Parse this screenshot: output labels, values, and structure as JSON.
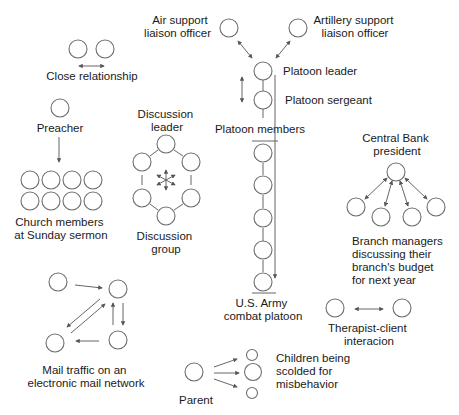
{
  "colors": {
    "background": "#ffffff",
    "stroke": "#6e6e6e",
    "text": "#1a1a1a"
  },
  "groups": {
    "close_relationship": {
      "label": [
        "Close relationship"
      ]
    },
    "preacher": {
      "label": [
        "Preacher"
      ],
      "members_label": [
        "Church members",
        "at Sunday sermon"
      ]
    },
    "discussion": {
      "leader_label": [
        "Discussion",
        "leader"
      ],
      "group_label": [
        "Discussion",
        "group"
      ]
    },
    "platoon": {
      "air_support": [
        "Air support",
        "liaison officer"
      ],
      "artillery_support": [
        "Artillery support",
        "liaison officer"
      ],
      "leader": [
        "Platoon leader"
      ],
      "sergeant": [
        "Platoon sergeant"
      ],
      "members": [
        "Platoon members"
      ],
      "unit": [
        "U.S. Army",
        "combat platoon"
      ]
    },
    "central_bank": {
      "label": [
        "Central Bank",
        "president"
      ],
      "managers_label": [
        "Branch managers",
        "discussing their",
        "branch's budget",
        "for next year"
      ]
    },
    "therapist": {
      "label": [
        "Therapist-client",
        "interacion"
      ]
    },
    "mail": {
      "label": [
        "Mail traffic on an",
        "electronic mail network"
      ]
    },
    "parent": {
      "label": [
        "Parent"
      ],
      "children_label": [
        "Children being",
        "scolded for",
        "misbehavior"
      ]
    }
  }
}
